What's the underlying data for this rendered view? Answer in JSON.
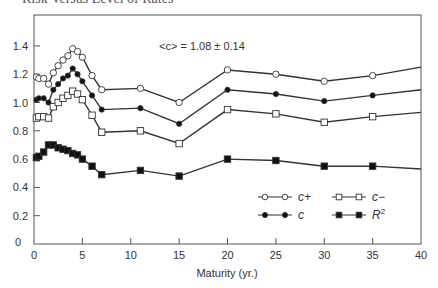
{
  "header": {
    "title": "Risk Versus Level of Rates"
  },
  "chart_data": {
    "type": "line",
    "title": "Risk Versus Level of Rates",
    "xlabel": "Maturity (yr.)",
    "ylabel": "",
    "xlim": [
      0,
      40
    ],
    "ylim": [
      0,
      1.5
    ],
    "x_ticks": [
      "0",
      "5",
      "10",
      "15",
      "20",
      "25",
      "30",
      "35",
      "40"
    ],
    "y_ticks": [
      "0",
      "0.2",
      "0.4",
      "0.6",
      "0.8",
      "1.0",
      "1.2",
      "1.4"
    ],
    "annotation": "<c> = 1.08 ± 0.14",
    "legend_position": "lower right",
    "grid": false,
    "series": [
      {
        "name": "c+",
        "marker": "open-circle",
        "x": [
          0.25,
          0.5,
          1,
          1.5,
          2,
          2.5,
          3,
          3.5,
          4,
          4.5,
          5,
          6,
          7,
          11,
          15,
          20,
          25,
          30,
          35,
          40
        ],
        "values": [
          1.18,
          1.17,
          1.17,
          1.13,
          1.21,
          1.26,
          1.3,
          1.33,
          1.38,
          1.36,
          1.32,
          1.19,
          1.09,
          1.1,
          1.0,
          1.23,
          1.2,
          1.15,
          1.19,
          1.25
        ]
      },
      {
        "name": "c",
        "marker": "filled-circle",
        "x": [
          0.25,
          0.5,
          1,
          1.5,
          2,
          2.5,
          3,
          3.5,
          4,
          4.5,
          5,
          6,
          7,
          11,
          15,
          20,
          25,
          30,
          35,
          40
        ],
        "values": [
          1.02,
          1.03,
          1.03,
          1.0,
          1.09,
          1.13,
          1.17,
          1.19,
          1.24,
          1.2,
          1.15,
          1.05,
          0.95,
          0.96,
          0.85,
          1.09,
          1.06,
          1.01,
          1.05,
          1.09
        ]
      },
      {
        "name": "c−",
        "marker": "open-square",
        "x": [
          0.25,
          0.5,
          1,
          1.5,
          2,
          2.5,
          3,
          3.5,
          4,
          4.5,
          5,
          6,
          7,
          11,
          15,
          20,
          25,
          30,
          35,
          40
        ],
        "values": [
          0.89,
          0.9,
          0.9,
          0.89,
          0.97,
          1.0,
          1.03,
          1.05,
          1.08,
          1.06,
          1.02,
          0.91,
          0.79,
          0.8,
          0.71,
          0.95,
          0.92,
          0.86,
          0.9,
          0.93
        ]
      },
      {
        "name": "R²",
        "marker": "filled-square",
        "x": [
          0.25,
          0.5,
          1,
          1.5,
          2,
          2.5,
          3,
          3.5,
          4,
          4.5,
          5,
          6,
          7,
          11,
          15,
          20,
          25,
          30,
          35,
          40
        ],
        "values": [
          0.61,
          0.62,
          0.65,
          0.7,
          0.7,
          0.68,
          0.67,
          0.66,
          0.64,
          0.63,
          0.6,
          0.55,
          0.49,
          0.52,
          0.48,
          0.6,
          0.59,
          0.55,
          0.55,
          0.53
        ]
      }
    ],
    "legend": [
      {
        "label": "c+",
        "marker": "open-circle"
      },
      {
        "label": "c−",
        "marker": "open-square"
      },
      {
        "label": "c",
        "marker": "filled-circle"
      },
      {
        "label": "R",
        "sup": "2",
        "marker": "filled-square"
      }
    ]
  }
}
